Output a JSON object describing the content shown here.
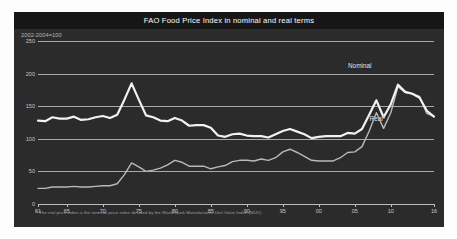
{
  "chart_data": {
    "type": "line",
    "title": "FAO Food Price Index in nominal and real terms",
    "subtitle": "2002-2004=100",
    "xlabel": "",
    "ylabel": "",
    "grid": true,
    "legend_position": "inline-annotation",
    "footnote": "* The real price index is the nominal price index deflated by the World Bank Manufactures Unit Value Index (MUV).",
    "ylim": [
      0,
      250
    ],
    "yticks": [
      0,
      50,
      100,
      150,
      200,
      250
    ],
    "ytick_labels": [
      "0",
      "50",
      "100",
      "150",
      "200",
      "250"
    ],
    "xlim": [
      1961,
      2016
    ],
    "xticks": [
      1961,
      1965,
      1970,
      1975,
      1980,
      1985,
      1990,
      1995,
      2000,
      2005,
      2010,
      2016
    ],
    "xtick_labels": [
      "61",
      "65",
      "70",
      "75",
      "80",
      "85",
      "90",
      "95",
      "00",
      "05",
      "10",
      "16"
    ],
    "x": [
      1961,
      1962,
      1963,
      1964,
      1965,
      1966,
      1967,
      1968,
      1969,
      1970,
      1971,
      1972,
      1973,
      1974,
      1975,
      1976,
      1977,
      1978,
      1979,
      1980,
      1981,
      1982,
      1983,
      1984,
      1985,
      1986,
      1987,
      1988,
      1989,
      1990,
      1991,
      1992,
      1993,
      1994,
      1995,
      1996,
      1997,
      1998,
      1999,
      2000,
      2001,
      2002,
      2003,
      2004,
      2005,
      2006,
      2007,
      2008,
      2009,
      2010,
      2011,
      2012,
      2013,
      2014,
      2015,
      2016
    ],
    "series": [
      {
        "name": "Nominal",
        "color": "#b9b9b9",
        "width": 1.4,
        "values": [
          24,
          24,
          26,
          26,
          26,
          27,
          26,
          26,
          27,
          28,
          28,
          31,
          45,
          63,
          57,
          50,
          52,
          55,
          60,
          67,
          64,
          58,
          58,
          58,
          54,
          57,
          59,
          65,
          67,
          67,
          66,
          69,
          67,
          71,
          80,
          84,
          79,
          73,
          67,
          66,
          66,
          66,
          71,
          79,
          80,
          88,
          112,
          140,
          116,
          140,
          180,
          171,
          169,
          165,
          139,
          134
        ]
      },
      {
        "name": "Real*",
        "color": "#f2f2f2",
        "width": 2.2,
        "values": [
          128,
          127,
          133,
          131,
          131,
          134,
          129,
          130,
          133,
          135,
          132,
          137,
          160,
          185,
          160,
          136,
          133,
          128,
          127,
          132,
          128,
          120,
          121,
          121,
          117,
          105,
          103,
          107,
          108,
          105,
          104,
          104,
          102,
          107,
          112,
          115,
          111,
          107,
          101,
          103,
          104,
          104,
          104,
          109,
          108,
          115,
          137,
          159,
          133,
          153,
          183,
          172,
          169,
          163,
          143,
          134
        ]
      }
    ],
    "annotations": [
      {
        "text": "Nominal",
        "x": 2006,
        "y": 212
      },
      {
        "text": "Real*",
        "x": 2009,
        "y": 130
      }
    ]
  },
  "style": {
    "page_background": "#fdfdfd",
    "panel_background": "#2b2b2b",
    "title_band_background": "#161616",
    "title_color": "#e8e8e8",
    "axis_color": "#bdbdbd",
    "grid_color": "#a9a9a9",
    "tick_label_color": "#c6c6c6",
    "footnote_color": "#9d9d9d"
  }
}
